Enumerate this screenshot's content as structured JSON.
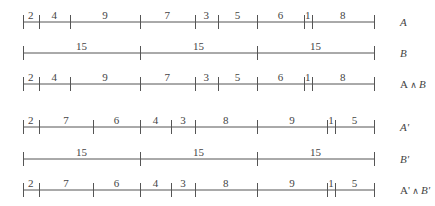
{
  "diagram": {
    "scale": {
      "x0": 23,
      "px_per_unit": 7.8,
      "tick_half_height": 7
    },
    "rows": [
      {
        "id": "A",
        "label_main": "A",
        "label_op": "",
        "label_second": "",
        "italic": true,
        "y": 22,
        "segments": [
          2,
          4,
          9,
          7,
          3,
          5,
          6,
          1,
          8
        ]
      },
      {
        "id": "B",
        "label_main": "B",
        "label_op": "",
        "label_second": "",
        "italic": true,
        "y": 53,
        "segments": [
          15,
          15,
          15
        ]
      },
      {
        "id": "A_and_B",
        "label_main": "A",
        "label_op": " ∧ ",
        "label_second": "B",
        "italic": false,
        "y": 84,
        "segments": [
          2,
          4,
          9,
          7,
          3,
          5,
          6,
          1,
          8
        ]
      },
      {
        "id": "A_prime",
        "label_main": "A'",
        "label_op": "",
        "label_second": "",
        "italic": true,
        "y": 127,
        "segments": [
          2,
          7,
          6,
          4,
          3,
          8,
          9,
          1,
          5
        ]
      },
      {
        "id": "B_prime",
        "label_main": "B'",
        "label_op": "",
        "label_second": "",
        "italic": true,
        "y": 159,
        "segments": [
          15,
          15,
          15
        ]
      },
      {
        "id": "A_prime_and_B_prime",
        "label_main": "A'",
        "label_op": " ∧ ",
        "label_second": "B'",
        "italic": false,
        "y": 190,
        "segments": [
          2,
          7,
          6,
          4,
          3,
          8,
          9,
          1,
          5
        ]
      }
    ],
    "label_x": 400
  }
}
